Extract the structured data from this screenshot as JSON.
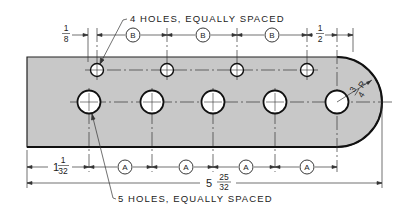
{
  "drawing": {
    "type": "technical engineering drawing",
    "part": "flat plate with rounded end and two rows of holes",
    "colors": {
      "plate_fill": "#c8c8c8",
      "line": "#222222",
      "background": "#ffffff",
      "hole_fill": "#ffffff"
    },
    "notes": {
      "top": "4 HOLES, EQUALLY SPACED",
      "bottom": "5 HOLES, EQUALLY SPACED"
    },
    "dimensions": {
      "top_left_offset": {
        "num": "1",
        "den": "8"
      },
      "top_right_offset": {
        "num": "1",
        "den": "2"
      },
      "top_spacing_label": "B",
      "top_spacing_count": 3,
      "bottom_left_offset": {
        "whole": "1",
        "num": "1",
        "den": "32"
      },
      "bottom_spacing_label": "A",
      "bottom_spacing_count": 4,
      "overall_length": {
        "whole": "5",
        "num": "25",
        "den": "32"
      },
      "radius": {
        "num": "3",
        "den": "4",
        "suffix": "R"
      }
    },
    "holes": {
      "small_row_count": 4,
      "large_row_count": 5
    }
  }
}
